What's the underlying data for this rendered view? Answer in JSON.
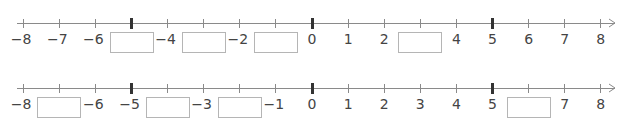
{
  "number_lines": [
    {
      "id": "line-1",
      "min": -8,
      "max": 8,
      "major_ticks": [
        -5,
        0,
        5
      ],
      "labels": [
        {
          "value": -8,
          "text": "−8"
        },
        {
          "value": -7,
          "text": "−7"
        },
        {
          "value": -6,
          "text": "−6"
        },
        {
          "value": -4,
          "text": "−4"
        },
        {
          "value": -2,
          "text": "−2"
        },
        {
          "value": 0,
          "text": "0"
        },
        {
          "value": 1,
          "text": "1"
        },
        {
          "value": 2,
          "text": "2"
        },
        {
          "value": 4,
          "text": "4"
        },
        {
          "value": 5,
          "text": "5"
        },
        {
          "value": 6,
          "text": "6"
        },
        {
          "value": 7,
          "text": "7"
        },
        {
          "value": 8,
          "text": "8"
        }
      ],
      "blanks": [
        {
          "value": -5,
          "answer": ""
        },
        {
          "value": -3,
          "answer": ""
        },
        {
          "value": -1,
          "answer": ""
        },
        {
          "value": 3,
          "answer": ""
        }
      ]
    },
    {
      "id": "line-2",
      "min": -8,
      "max": 8,
      "major_ticks": [
        -5,
        0,
        5
      ],
      "labels": [
        {
          "value": -8,
          "text": "−8"
        },
        {
          "value": -6,
          "text": "−6"
        },
        {
          "value": -5,
          "text": "−5"
        },
        {
          "value": -3,
          "text": "−3"
        },
        {
          "value": -1,
          "text": "−1"
        },
        {
          "value": 0,
          "text": "0"
        },
        {
          "value": 1,
          "text": "1"
        },
        {
          "value": 2,
          "text": "2"
        },
        {
          "value": 3,
          "text": "3"
        },
        {
          "value": 4,
          "text": "4"
        },
        {
          "value": 5,
          "text": "5"
        },
        {
          "value": 7,
          "text": "7"
        },
        {
          "value": 8,
          "text": "8"
        }
      ],
      "blanks": [
        {
          "value": -7,
          "answer": ""
        },
        {
          "value": -4,
          "answer": ""
        },
        {
          "value": -2,
          "answer": ""
        },
        {
          "value": 6,
          "answer": ""
        }
      ]
    }
  ],
  "colors": {
    "axis": "#8a8a8a",
    "major_tick": "#333333",
    "label": "#444444",
    "box_border": "#b5b5b5"
  }
}
